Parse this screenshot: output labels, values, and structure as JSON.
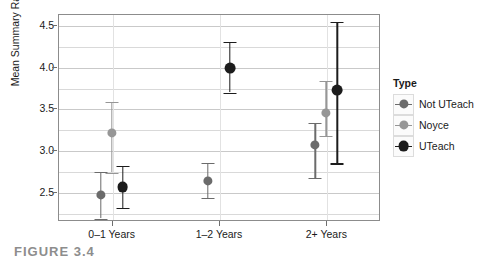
{
  "chart_data": {
    "type": "scatter",
    "title": "",
    "xlabel": "",
    "ylabel": "Mean Summary Ratings",
    "ylim": [
      2.15,
      4.63
    ],
    "yticks": [
      2.5,
      3.0,
      3.5,
      4.0,
      4.5
    ],
    "ytick_labels": [
      "2.5",
      "3.0",
      "3.5",
      "4.0",
      "4.5"
    ],
    "categories": [
      "0–1 Years",
      "1–2 Years",
      "2+ Years"
    ],
    "grid": true,
    "legend_position": "right",
    "legend_title": "Type",
    "series": [
      {
        "name": "Not UTeach",
        "color": "#6b6b6b",
        "values": [
          2.46,
          2.63,
          3.06
        ],
        "err_low": [
          2.18,
          2.43,
          2.67
        ],
        "err_high": [
          2.74,
          2.85,
          3.33
        ]
      },
      {
        "name": "Noyce",
        "color": "#969696",
        "values": [
          3.21,
          null,
          3.45
        ],
        "err_low": [
          2.73,
          null,
          3.17
        ],
        "err_high": [
          3.58,
          null,
          3.83
        ]
      },
      {
        "name": "UTeach",
        "color": "#1c1c1c",
        "values": [
          2.56,
          3.98,
          3.72
        ],
        "err_low": [
          2.31,
          3.69,
          2.84
        ],
        "err_high": [
          2.81,
          4.3,
          4.54
        ]
      }
    ]
  },
  "axis": {
    "y_title": "Mean Summary Ratings"
  },
  "legend": {
    "title": "Type",
    "items": [
      {
        "label": "Not UTeach",
        "color": "#6b6b6b"
      },
      {
        "label": "Noyce",
        "color": "#969696"
      },
      {
        "label": "UTeach",
        "color": "#1c1c1c"
      }
    ]
  },
  "caption": {
    "text": "FIGURE 3.4"
  },
  "colors": {
    "panel_border": "#8c8c8c",
    "gridline": "#d9d9d9",
    "text": "#1a1a1a"
  }
}
